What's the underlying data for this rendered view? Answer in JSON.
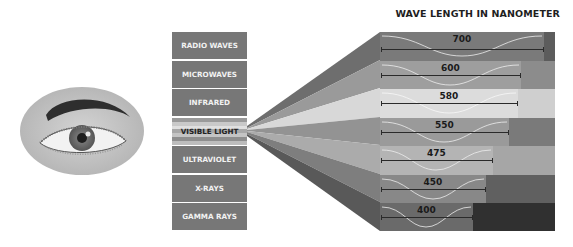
{
  "title": "WAVE LENGTH IN NANOMETER",
  "spectrum_labels": [
    {
      "label": "RADIO WAVES"
    },
    {
      "label": "MICROWAVES"
    },
    {
      "label": "INFRARED"
    },
    {
      "label": "VISIBLE LIGHT"
    },
    {
      "label": "ULTRAVIOLET"
    },
    {
      "label": "X-RAYS"
    },
    {
      "label": "GAMMA RAYS"
    }
  ],
  "wavelengths": [
    {
      "value": "700",
      "bar_color": "#7a7a7a",
      "end_color": "#5c5c5c",
      "fan_color": "#6e6e6e"
    },
    {
      "value": "600",
      "bar_color": "#9e9e9e",
      "end_color": "#8c8c8c",
      "fan_color": "#9a9a9a"
    },
    {
      "value": "580",
      "bar_color": "#dcdcdc",
      "end_color": "#cfcfcf",
      "fan_color": "#d8d8d8"
    },
    {
      "value": "550",
      "bar_color": "#9a9a9a",
      "end_color": "#7a7a7a",
      "fan_color": "#939393"
    },
    {
      "value": "475",
      "bar_color": "#b4b4b4",
      "end_color": "#a6a6a6",
      "fan_color": "#ababab"
    },
    {
      "value": "450",
      "bar_color": "#888888",
      "end_color": "#606060",
      "fan_color": "#7e7e7e"
    },
    {
      "value": "400",
      "bar_color": "#6a6a6a",
      "end_color": "#303030",
      "fan_color": "#595959"
    }
  ],
  "eye": {
    "description": "human eye illustration"
  }
}
